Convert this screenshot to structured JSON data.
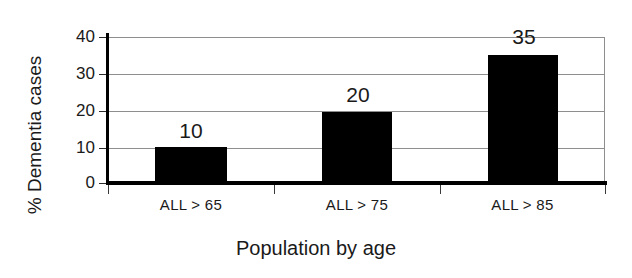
{
  "chart_data": {
    "type": "bar",
    "title": "",
    "categories": [
      "ALL > 65",
      "ALL > 75",
      "ALL > 85"
    ],
    "values": [
      10,
      20,
      35
    ],
    "plotted_values": [
      9.8,
      19.5,
      35
    ],
    "data_labels": [
      "10",
      "20",
      "35"
    ],
    "xlabel": "Population by age",
    "ylabel": "% Dementia cases",
    "ylim": [
      0,
      40
    ],
    "yticks": [
      0,
      10,
      20,
      30,
      40
    ],
    "ytick_labels": [
      "0",
      "10",
      "20",
      "30",
      "40"
    ],
    "grid": true,
    "grid_axis": "y",
    "legend": false,
    "bar_color": "#000000",
    "grid_color": "#8e8e8e",
    "axis_color": "#000000",
    "background": "#ffffff"
  },
  "axes": {
    "y_title": "% Dementia cases",
    "x_title": "Population by age"
  }
}
